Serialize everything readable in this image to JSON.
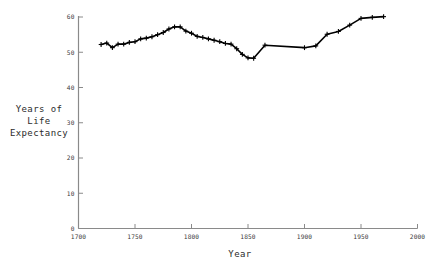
{
  "chart_data": {
    "type": "line",
    "title": "",
    "xlabel": "Year",
    "ylabel": "Years of\nLife\nExpectancy",
    "ylabel_lines": [
      "Years of",
      "Life",
      "Expectancy"
    ],
    "xlim": [
      1700,
      2000
    ],
    "ylim": [
      0,
      60
    ],
    "xticks": [
      1700,
      1750,
      1800,
      1850,
      1900,
      1950,
      2000
    ],
    "yticks": [
      0,
      10,
      20,
      30,
      40,
      50,
      60
    ],
    "xtick_labels": [
      "1700",
      "1750",
      "1800",
      "1850",
      "1900",
      "1950",
      "2000"
    ],
    "ytick_labels": [
      "0",
      "10",
      "20",
      "30",
      "40",
      "50",
      "60"
    ],
    "grid": false,
    "legend": null,
    "marker": "plus",
    "line_color": "#000000",
    "axis_color": "#8a8a8a",
    "x": [
      1720,
      1725,
      1730,
      1735,
      1740,
      1745,
      1750,
      1755,
      1760,
      1765,
      1770,
      1775,
      1780,
      1785,
      1790,
      1795,
      1800,
      1805,
      1810,
      1815,
      1820,
      1825,
      1830,
      1835,
      1840,
      1845,
      1850,
      1855,
      1865,
      1900,
      1910,
      1920,
      1930,
      1940,
      1950,
      1960,
      1970
    ],
    "y": [
      52.2,
      52.6,
      51.3,
      52.3,
      52.3,
      52.8,
      53.0,
      53.8,
      54.0,
      54.4,
      55.0,
      55.6,
      56.6,
      57.2,
      57.2,
      56.0,
      55.4,
      54.5,
      54.2,
      53.8,
      53.4,
      53.0,
      52.5,
      52.3,
      51.0,
      49.4,
      48.4,
      48.3,
      52.0,
      51.3,
      51.8,
      55.1,
      55.9,
      57.7,
      59.6,
      59.9,
      60.1
    ],
    "series": [
      {
        "name": "Life expectancy",
        "x": [
          1720,
          1725,
          1730,
          1735,
          1740,
          1745,
          1750,
          1755,
          1760,
          1765,
          1770,
          1775,
          1780,
          1785,
          1790,
          1795,
          1800,
          1805,
          1810,
          1815,
          1820,
          1825,
          1830,
          1835,
          1840,
          1845,
          1850,
          1855,
          1865,
          1900,
          1910,
          1920,
          1930,
          1940,
          1950,
          1960,
          1970
        ],
        "values": [
          52.2,
          52.6,
          51.3,
          52.3,
          52.3,
          52.8,
          53.0,
          53.8,
          54.0,
          54.4,
          55.0,
          55.6,
          56.6,
          57.2,
          57.2,
          56.0,
          55.4,
          54.5,
          54.2,
          53.8,
          53.4,
          53.0,
          52.5,
          52.3,
          51.0,
          49.4,
          48.4,
          48.3,
          52.0,
          51.3,
          51.8,
          55.1,
          55.9,
          57.7,
          59.6,
          59.9,
          60.1
        ]
      }
    ]
  }
}
